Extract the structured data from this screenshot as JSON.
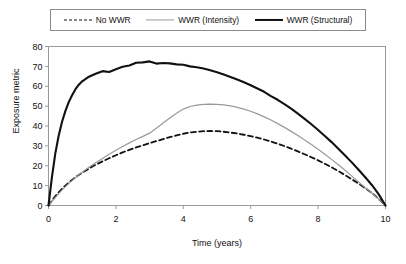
{
  "chart_data": {
    "type": "line",
    "title": "",
    "xlabel": "Time (years)",
    "ylabel": "Exposure metric",
    "xlim": [
      0,
      10
    ],
    "ylim": [
      0,
      80
    ],
    "xticks": [
      "0",
      "2",
      "4",
      "6",
      "8",
      "10"
    ],
    "xtick_values": [
      0,
      2,
      4,
      6,
      8,
      10
    ],
    "yticks": [
      "0",
      "10",
      "20",
      "30",
      "40",
      "50",
      "60",
      "70",
      "80"
    ],
    "ytick_values": [
      0,
      10,
      20,
      30,
      40,
      50,
      60,
      70,
      80
    ],
    "grid": false,
    "legend_position": "top",
    "x": [
      0,
      0.1,
      0.2,
      0.3,
      0.4,
      0.5,
      0.6,
      0.7,
      0.8,
      0.9,
      1.0,
      1.2,
      1.4,
      1.6,
      1.8,
      2.0,
      2.2,
      2.4,
      2.6,
      2.8,
      3.0,
      3.2,
      3.4,
      3.6,
      3.8,
      4.0,
      4.2,
      4.4,
      4.6,
      4.8,
      5.0,
      5.2,
      5.4,
      5.6,
      5.8,
      6.0,
      6.2,
      6.4,
      6.6,
      6.8,
      7.0,
      7.2,
      7.4,
      7.6,
      7.8,
      8.0,
      8.2,
      8.4,
      8.6,
      8.8,
      9.0,
      9.2,
      9.4,
      9.6,
      9.8,
      10.0
    ],
    "series": [
      {
        "name": "No WWR",
        "style": "dashed",
        "color": "#111111",
        "width": 1.8,
        "peak_value": 37.5,
        "peak_time": 3.8,
        "values": [
          0,
          2.4,
          4.6,
          6.6,
          8.4,
          10.0,
          11.5,
          12.9,
          14.2,
          15.4,
          16.5,
          18.6,
          20.5,
          22.2,
          23.8,
          25.3,
          26.7,
          28.0,
          29.2,
          30.3,
          31.4,
          32.4,
          33.4,
          34.4,
          35.3,
          36.1,
          36.7,
          37.1,
          37.4,
          37.5,
          37.4,
          37.1,
          36.7,
          36.2,
          35.6,
          34.9,
          34.1,
          33.2,
          32.2,
          31.1,
          29.9,
          28.6,
          27.2,
          25.8,
          24.3,
          22.7,
          21.0,
          19.2,
          17.3,
          15.3,
          13.2,
          11.0,
          8.7,
          6.3,
          3.3,
          0
        ],
        "values_note": "dashed black curve, lowest of the three"
      },
      {
        "name": "WWR (Intensity)",
        "style": "solid",
        "color": "#9a9a9a",
        "width": 1.2,
        "peak_value": 51.0,
        "peak_time": 4.0,
        "values": [
          0,
          2.0,
          4.0,
          5.9,
          7.7,
          9.4,
          11.0,
          12.5,
          14.0,
          15.4,
          16.7,
          19.2,
          21.5,
          23.7,
          25.8,
          27.8,
          29.7,
          31.5,
          33.2,
          34.8,
          36.4,
          38.9,
          41.5,
          44.0,
          46.4,
          48.5,
          49.8,
          50.5,
          50.9,
          51.0,
          50.9,
          50.6,
          50.1,
          49.4,
          48.5,
          47.4,
          46.1,
          44.6,
          43.0,
          41.2,
          39.3,
          37.3,
          35.2,
          33.0,
          30.7,
          28.3,
          25.8,
          23.2,
          20.5,
          17.7,
          14.8,
          11.8,
          8.9,
          6.2,
          3.2,
          0
        ],
        "values_note": "light gray solid curve, middle"
      },
      {
        "name": "WWR (Structural)",
        "style": "solid",
        "color": "#111111",
        "width": 2.1,
        "peak_value": 72.5,
        "peak_time": 2.6,
        "values": [
          0,
          14.0,
          26.0,
          35.0,
          42.0,
          47.5,
          52.0,
          55.5,
          58.5,
          60.8,
          62.5,
          64.8,
          66.3,
          67.6,
          67.2,
          68.6,
          69.8,
          70.4,
          71.8,
          72.0,
          72.5,
          71.4,
          71.7,
          71.5,
          71.0,
          70.8,
          70.0,
          69.6,
          68.9,
          68.0,
          67.0,
          65.9,
          64.7,
          63.4,
          62.0,
          60.5,
          58.9,
          57.2,
          55.0,
          53.2,
          51.0,
          48.7,
          46.2,
          43.6,
          40.9,
          38.0,
          35.0,
          31.9,
          28.6,
          25.2,
          21.7,
          18.0,
          14.2,
          10.2,
          5.6,
          0
        ],
        "values_note": "heavy black solid curve, highest, slightly noisy near peak"
      }
    ]
  },
  "legend": {
    "items": [
      {
        "label": "No WWR",
        "swatch": "dashed-line-sample"
      },
      {
        "label": "WWR (Intensity)",
        "swatch": "gray-line-sample"
      },
      {
        "label": "WWR (Structural)",
        "swatch": "black-line-sample"
      }
    ]
  },
  "axes": {
    "y_title": "Exposure metric",
    "x_title": "Time (years)"
  },
  "colors": {
    "structural": "#111111",
    "intensity": "#9a9a9a",
    "no_wwr": "#111111",
    "frame": "#9a9a9a",
    "background": "#ffffff"
  }
}
